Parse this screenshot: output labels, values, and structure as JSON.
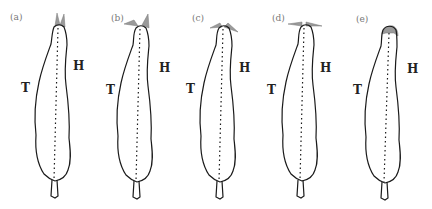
{
  "figure": {
    "panels": [
      {
        "label": "(a)",
        "left_marker": "T",
        "right_marker": "H",
        "head_cones": "both-up"
      },
      {
        "label": "(b)",
        "left_marker": "T",
        "right_marker": "H",
        "head_cones": "left-side-right-up"
      },
      {
        "label": "(c)",
        "left_marker": "T",
        "right_marker": "H",
        "head_cones": "both-angled-out"
      },
      {
        "label": "(d)",
        "left_marker": "T",
        "right_marker": "H",
        "head_cones": "both-horizontal"
      },
      {
        "label": "(e)",
        "left_marker": "T",
        "right_marker": "H",
        "head_cones": "retracted"
      }
    ],
    "colors": {
      "outline": "#1a1a1a",
      "cone": "#9a9a9a",
      "label": "#777777"
    }
  }
}
